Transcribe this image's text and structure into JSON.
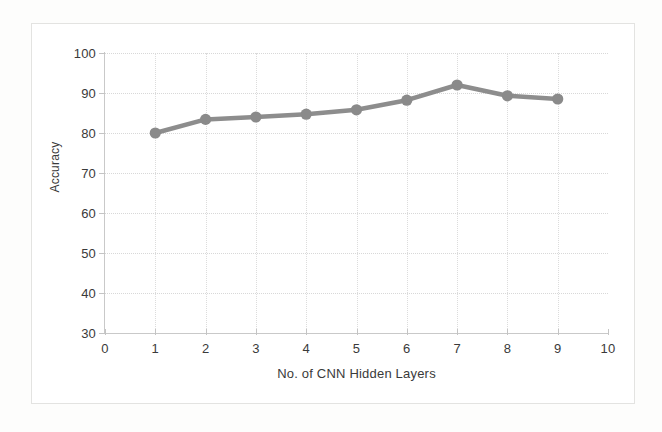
{
  "chart_data": {
    "type": "line",
    "title": "",
    "xlabel": "No. of CNN Hidden Layers",
    "ylabel": "Accuracy",
    "x": [
      1,
      2,
      3,
      4,
      5,
      6,
      7,
      8,
      9
    ],
    "values": [
      80.0,
      83.4,
      84.0,
      84.7,
      85.8,
      88.2,
      92.0,
      89.3,
      88.5
    ],
    "series": [
      {
        "name": "Accuracy",
        "values": [
          80.0,
          83.4,
          84.0,
          84.7,
          85.8,
          88.2,
          92.0,
          89.3,
          88.5
        ]
      }
    ],
    "xlim": [
      0,
      10
    ],
    "ylim": [
      30,
      100
    ],
    "xticks": [
      "0",
      "1",
      "2",
      "3",
      "4",
      "5",
      "6",
      "7",
      "8",
      "9",
      "10"
    ],
    "yticks": [
      "30",
      "40",
      "50",
      "60",
      "70",
      "80",
      "90",
      "100"
    ],
    "grid": true,
    "legend": "none",
    "marker": "circle",
    "line_color": "#8d8d8d",
    "marker_color": "#8a8a8a",
    "grid_color": "#d8d8d8",
    "axis_color": "#c9c9c9",
    "text_color": "#3a3a3a"
  },
  "axes": {
    "y_title": "Accuracy",
    "x_title": "No. of CNN Hidden Layers",
    "y_ticks": [
      "100",
      "90",
      "80",
      "70",
      "60",
      "50",
      "40",
      "30"
    ],
    "x_ticks": [
      "0",
      "1",
      "2",
      "3",
      "4",
      "5",
      "6",
      "7",
      "8",
      "9",
      "10"
    ]
  }
}
